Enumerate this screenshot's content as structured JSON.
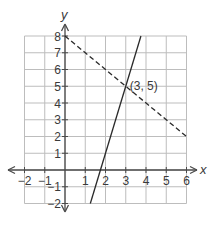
{
  "chart_data": {
    "type": "line",
    "title": "",
    "xlabel": "x",
    "ylabel": "y",
    "xlim": [
      -2,
      6
    ],
    "ylim": [
      -2,
      8
    ],
    "grid": true,
    "x_ticks": [
      "−2",
      "−1",
      "1",
      "2",
      "3",
      "4",
      "5",
      "6"
    ],
    "y_ticks": [
      "8",
      "7",
      "6",
      "5",
      "4",
      "3",
      "2",
      "1",
      "−1",
      "−2"
    ],
    "series": [
      {
        "name": "solid line",
        "style": "solid",
        "equation": "y = 4x − 7",
        "points": [
          [
            1.25,
            -2
          ],
          [
            3.75,
            8
          ]
        ]
      },
      {
        "name": "dashed line",
        "style": "dashed",
        "equation": "y = −x + 8",
        "points": [
          [
            0,
            8
          ],
          [
            6,
            2
          ]
        ]
      }
    ],
    "annotations": [
      {
        "text": "(3, 5)",
        "x": 3,
        "y": 5
      }
    ]
  },
  "colors": {
    "grid": "#bdbdbd",
    "axis": "#4a4a4a",
    "line": "#2a2a2a"
  }
}
